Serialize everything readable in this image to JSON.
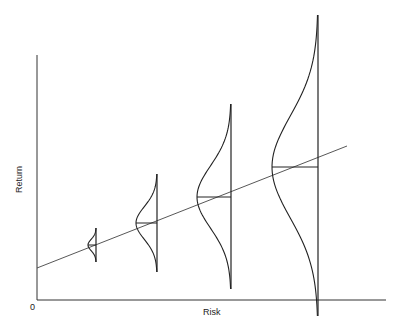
{
  "diagram": {
    "xlabel": "Risk",
    "ylabel": "Return",
    "origin_label": "0",
    "line_color": "#222222",
    "distributions": [
      {
        "x": 96,
        "top": 228,
        "bottom": 262,
        "peak_x": 88,
        "mean_y": 245
      },
      {
        "x": 157,
        "top": 174,
        "bottom": 272,
        "peak_x": 136,
        "mean_y": 223
      },
      {
        "x": 231,
        "top": 104,
        "bottom": 289,
        "peak_x": 197,
        "mean_y": 197
      },
      {
        "x": 318,
        "top": 15,
        "bottom": 316,
        "peak_x": 272,
        "mean_y": 167
      }
    ],
    "trend_line": {
      "x1": 37,
      "y1": 268,
      "x2": 347,
      "y2": 146
    }
  },
  "chart_data": {
    "type": "line",
    "title": "",
    "xlabel": "Risk",
    "ylabel": "Return",
    "distributions_relative_spread": [
      1,
      2.9,
      5.4,
      8.9
    ]
  }
}
